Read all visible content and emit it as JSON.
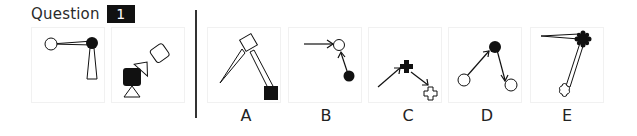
{
  "question": {
    "label": "Question",
    "number": "1"
  },
  "colors": {
    "ink": "#111111",
    "panel_border": "#f1f1f1",
    "background": "#ffffff"
  },
  "question_panels": [
    {
      "id": "q1",
      "description": "open circle and filled circle joined by thin wedge; thin tall triangle hanging below filled circle"
    },
    {
      "id": "q2",
      "description": "filled rounded square with triangle below; small triangle connecting to rotated open rounded square"
    }
  ],
  "options": [
    {
      "label": "A",
      "description": "rotated open square with thin wedge to point at lower-left and wedge to filled square at lower-right"
    },
    {
      "label": "B",
      "description": "arrow from left into open circle; arrow from filled circle up into open circle"
    },
    {
      "label": "C",
      "description": "arrow into filled cross; arrow from filled cross to outlined cross"
    },
    {
      "label": "D",
      "description": "arrow from open circle to filled circle; arrow from filled circle to another open circle"
    },
    {
      "label": "E",
      "description": "filled cog shape with thin wedge to the left and thin wedge down to outlined cog shape"
    }
  ]
}
